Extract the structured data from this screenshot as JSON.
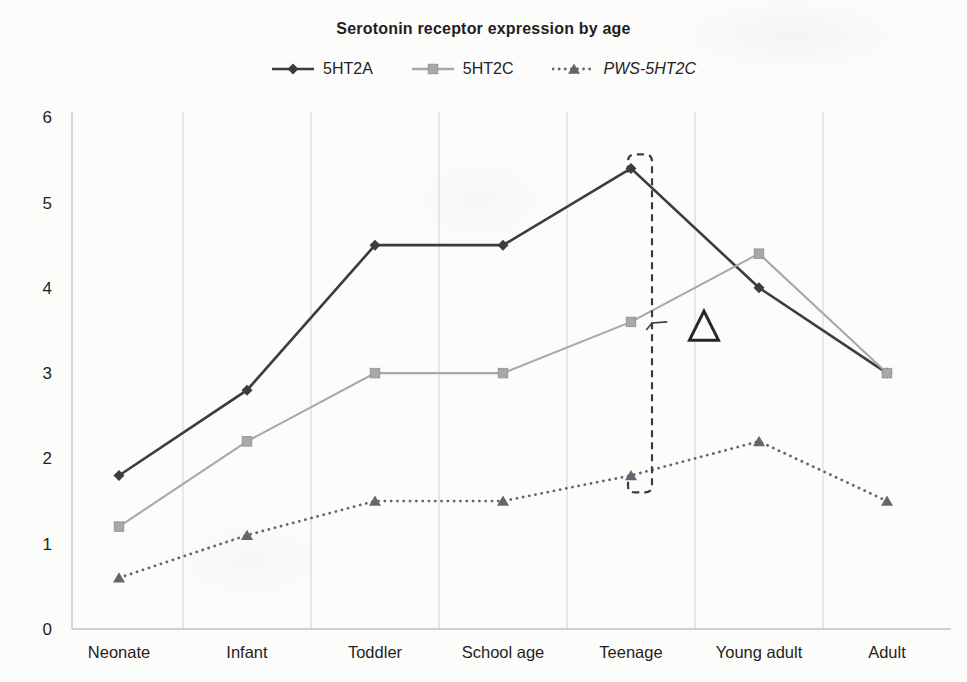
{
  "title": "Serotonin receptor expression by age",
  "colors": {
    "background": "#fcfcfa",
    "grid": "#d9d9d4",
    "axis": "#c2c2bd",
    "text": "#1f1f22",
    "annotation": "#3b3b45",
    "delta_outline": "#26262e"
  },
  "chart_data": {
    "type": "line",
    "title": "Serotonin receptor expression by age",
    "categories": [
      "Neonate",
      "Infant",
      "Toddler",
      "School age",
      "Teenage",
      "Young adult",
      "Adult"
    ],
    "series": [
      {
        "name": "5HT2A",
        "values": [
          1.8,
          2.8,
          4.5,
          4.5,
          5.4,
          4.0,
          3.0
        ],
        "color": "#3b3b45",
        "line_style": "solid",
        "marker": "diamond",
        "italic_label": false
      },
      {
        "name": "5HT2C",
        "values": [
          1.2,
          2.2,
          3.0,
          3.0,
          3.6,
          4.4,
          3.0
        ],
        "color": "#a8a8a8",
        "line_style": "solid",
        "marker": "square",
        "italic_label": false
      },
      {
        "name": "PWS-5HT2C",
        "values": [
          0.6,
          1.1,
          1.5,
          1.5,
          1.8,
          2.2,
          1.5
        ],
        "color": "#65656f",
        "line_style": "dotted",
        "marker": "triangle",
        "italic_label": true
      }
    ],
    "xlabel": "",
    "ylabel": "",
    "ylim": [
      0,
      6
    ],
    "yticks": [
      0,
      1,
      2,
      3,
      4,
      5,
      6
    ],
    "grid": "vertical-between-categories",
    "legend_position": "top",
    "annotations": [
      {
        "type": "dashed-bracket",
        "category_index": 4,
        "from_value": 5.4,
        "to_value": 1.8
      },
      {
        "type": "pointer-tick",
        "category_x": 4.15,
        "value": 3.6
      },
      {
        "type": "open-triangle-delta",
        "category_x": 4.57,
        "value": 3.55
      }
    ]
  }
}
